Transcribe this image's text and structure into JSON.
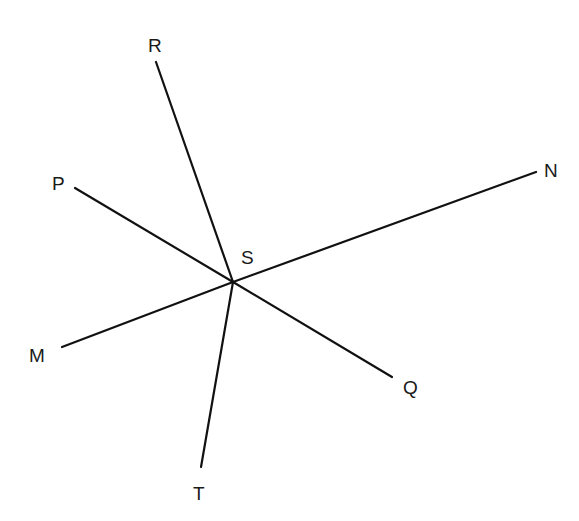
{
  "diagram": {
    "type": "intersecting-lines",
    "center": {
      "label": "S",
      "x": 233,
      "y": 282,
      "label_x": 241,
      "label_y": 264
    },
    "line_color": "#111111",
    "rays": [
      {
        "label": "R",
        "x1": 233,
        "y1": 282,
        "x2": 156,
        "y2": 62,
        "label_x": 148,
        "label_y": 52
      },
      {
        "label": "P",
        "x1": 233,
        "y1": 282,
        "x2": 75,
        "y2": 188,
        "label_x": 52,
        "label_y": 190
      },
      {
        "label": "N",
        "x1": 233,
        "y1": 282,
        "x2": 536,
        "y2": 172,
        "label_x": 544,
        "label_y": 177
      },
      {
        "label": "M",
        "x1": 233,
        "y1": 282,
        "x2": 62,
        "y2": 347,
        "label_x": 29,
        "label_y": 362
      },
      {
        "label": "Q",
        "x1": 233,
        "y1": 282,
        "x2": 392,
        "y2": 377,
        "label_x": 403,
        "label_y": 394
      },
      {
        "label": "T",
        "x1": 233,
        "y1": 282,
        "x2": 201,
        "y2": 467,
        "label_x": 193,
        "label_y": 500
      }
    ]
  }
}
